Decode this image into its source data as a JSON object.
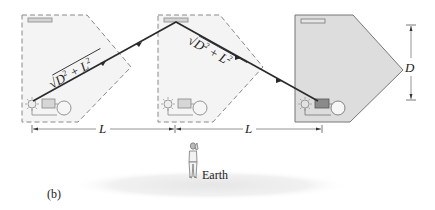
{
  "figure": {
    "panel_label": "(b)",
    "earth_label": "Earth",
    "distance_label_left": "L",
    "distance_label_right": "L",
    "height_label": "D",
    "path_label_1": "√D² + L²",
    "path_label_2": "√D² + L²",
    "path_label_1_parts": {
      "radical": "√",
      "a": "D",
      "sup_a": "2",
      "op": " + ",
      "b": "L",
      "sup_b": "2"
    },
    "path_label_2_parts": {
      "radical": "√",
      "a": "D",
      "sup_a": "2",
      "op": " + ",
      "b": "L",
      "sup_b": "2"
    }
  },
  "colors": {
    "ghost_fill": "#f3f3f3",
    "solid_fill": "#dcdcdc",
    "outline": "#777777",
    "ray": "#2a2a2a",
    "mirror": "#cfcfcf",
    "ground": "#ececec"
  }
}
